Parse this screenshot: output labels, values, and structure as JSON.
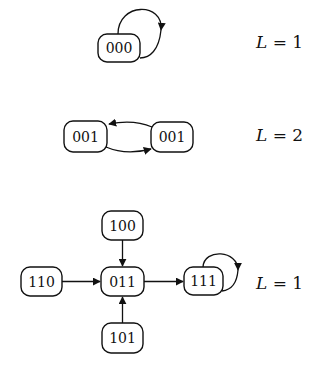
{
  "diagram": {
    "groups": [
      {
        "id": "cycle-L1-top",
        "nodes": [
          {
            "id": "n000",
            "label": "000"
          }
        ],
        "edges": [
          {
            "from": "n000",
            "to": "n000",
            "type": "self-loop"
          }
        ],
        "cycle_label": {
          "var": "L",
          "eq": " = 1"
        }
      },
      {
        "id": "cycle-L2",
        "nodes": [
          {
            "id": "n001a",
            "label": "001"
          },
          {
            "id": "n001b",
            "label": "001"
          }
        ],
        "edges": [
          {
            "from": "n001b",
            "to": "n001a",
            "type": "curved"
          },
          {
            "from": "n001a",
            "to": "n001b",
            "type": "curved"
          }
        ],
        "cycle_label": {
          "var": "L",
          "eq": " = 2"
        }
      },
      {
        "id": "cycle-L1-bottom",
        "nodes": [
          {
            "id": "n100",
            "label": "100"
          },
          {
            "id": "n110",
            "label": "110"
          },
          {
            "id": "n011",
            "label": "011"
          },
          {
            "id": "n111",
            "label": "111"
          },
          {
            "id": "n101",
            "label": "101"
          }
        ],
        "edges": [
          {
            "from": "n100",
            "to": "n011",
            "type": "straight"
          },
          {
            "from": "n110",
            "to": "n011",
            "type": "straight"
          },
          {
            "from": "n101",
            "to": "n011",
            "type": "straight"
          },
          {
            "from": "n011",
            "to": "n111",
            "type": "straight"
          },
          {
            "from": "n111",
            "to": "n111",
            "type": "self-loop"
          }
        ],
        "cycle_label": {
          "var": "L",
          "eq": " = 1"
        }
      }
    ]
  }
}
